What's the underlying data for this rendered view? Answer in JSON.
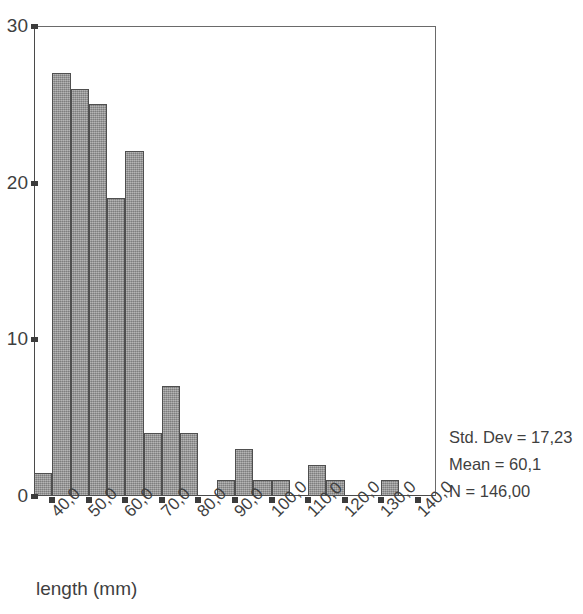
{
  "chart_data": {
    "type": "bar",
    "title": "",
    "subtitle": "",
    "xlabel": "length (mm)",
    "ylabel": "",
    "grid": false,
    "legend_position": "none",
    "xlim": [
      35,
      145
    ],
    "ylim": [
      0,
      30
    ],
    "y_ticks": [
      0,
      10,
      20,
      30
    ],
    "y_tick_labels": [
      "0",
      "10",
      "20",
      "30"
    ],
    "x_ticks": [
      40,
      50,
      60,
      70,
      80,
      90,
      100,
      110,
      120,
      130,
      140
    ],
    "x_tick_labels": [
      "40,0",
      "50,0",
      "60,0",
      "70,0",
      "80,0",
      "90,0",
      "100,0",
      "110,0",
      "120,0",
      "130,0",
      "140,0"
    ],
    "bin_width": 5,
    "bin_centers": [
      37.5,
      42.5,
      47.5,
      52.5,
      57.5,
      62.5,
      67.5,
      72.5,
      77.5,
      82.5,
      87.5,
      92.5,
      97.5,
      102.5,
      107.5,
      112.5,
      117.5,
      122.5,
      127.5,
      132.5,
      137.5
    ],
    "categories": [
      "37,5",
      "42,5",
      "47,5",
      "52,5",
      "57,5",
      "62,5",
      "67,5",
      "72,5",
      "77,5",
      "82,5",
      "87,5",
      "92,5",
      "97,5",
      "102,5",
      "107,5",
      "112,5",
      "117,5",
      "122,5",
      "127,5",
      "132,5",
      "137,5"
    ],
    "values": [
      1.5,
      27,
      26,
      25,
      19,
      22,
      4,
      7,
      4,
      0,
      1,
      3,
      1,
      1,
      0,
      2,
      1,
      0,
      0,
      1,
      0
    ],
    "annotations": [
      "Std. Dev = 17,23",
      "Mean = 60,1",
      "N = 146,00"
    ]
  },
  "statistics": {
    "std_dev": "Std. Dev = 17,23",
    "mean": "Mean = 60,1",
    "n": "N = 146,00"
  },
  "axis": {
    "x_title": "length (mm)"
  },
  "colors": {
    "bar_fill": "#9a9a9a",
    "bar_edge": "#4f4f4f",
    "axis": "#4a4a4a",
    "text": "#3f3f3f"
  }
}
